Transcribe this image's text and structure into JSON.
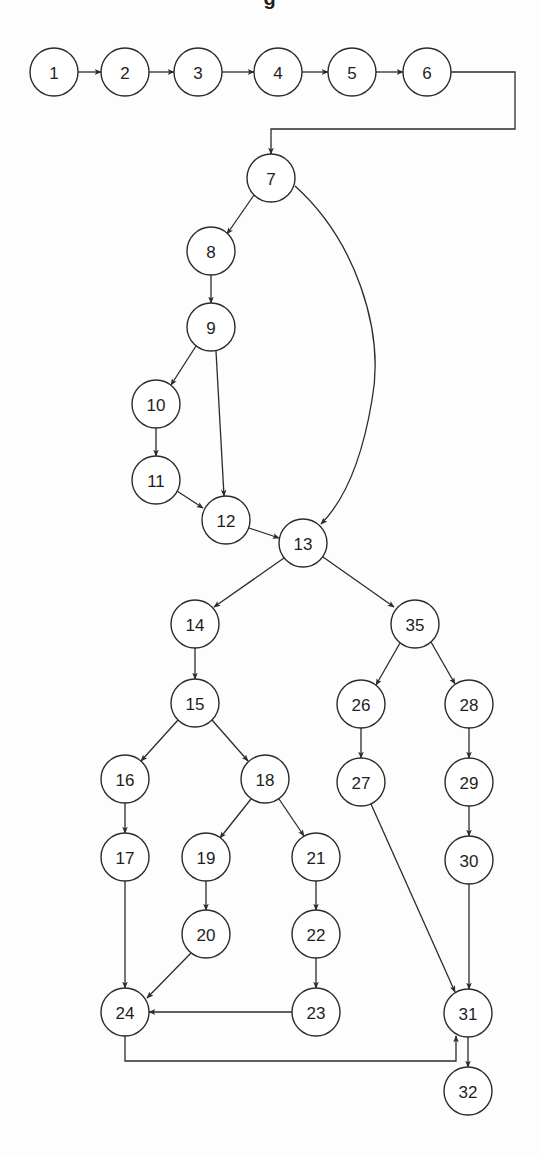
{
  "diagram": {
    "type": "control-flow-graph",
    "title_fragment": "g",
    "colors": {
      "stroke": "#2b2b2b",
      "node_fill": "#ffffff",
      "text": "#1e1e1e",
      "background": "#fdfdfd"
    },
    "node_radius": 24,
    "nodes": [
      {
        "id": "1",
        "label": "1",
        "x": 54,
        "y": 72
      },
      {
        "id": "2",
        "label": "2",
        "x": 125,
        "y": 72
      },
      {
        "id": "3",
        "label": "3",
        "x": 198,
        "y": 72
      },
      {
        "id": "4",
        "label": "4",
        "x": 278,
        "y": 72
      },
      {
        "id": "5",
        "label": "5",
        "x": 352,
        "y": 72
      },
      {
        "id": "6",
        "label": "6",
        "x": 427,
        "y": 72
      },
      {
        "id": "7",
        "label": "7",
        "x": 271,
        "y": 178
      },
      {
        "id": "8",
        "label": "8",
        "x": 211,
        "y": 251
      },
      {
        "id": "9",
        "label": "9",
        "x": 211,
        "y": 327
      },
      {
        "id": "10",
        "label": "10",
        "x": 156,
        "y": 404
      },
      {
        "id": "11",
        "label": "11",
        "x": 156,
        "y": 480
      },
      {
        "id": "12",
        "label": "12",
        "x": 226,
        "y": 520
      },
      {
        "id": "13",
        "label": "13",
        "x": 303,
        "y": 543
      },
      {
        "id": "14",
        "label": "14",
        "x": 195,
        "y": 624
      },
      {
        "id": "15",
        "label": "15",
        "x": 195,
        "y": 703
      },
      {
        "id": "16",
        "label": "16",
        "x": 125,
        "y": 779
      },
      {
        "id": "17",
        "label": "17",
        "x": 125,
        "y": 857
      },
      {
        "id": "18",
        "label": "18",
        "x": 265,
        "y": 779
      },
      {
        "id": "19",
        "label": "19",
        "x": 206,
        "y": 857
      },
      {
        "id": "20",
        "label": "20",
        "x": 206,
        "y": 934
      },
      {
        "id": "21",
        "label": "21",
        "x": 316,
        "y": 857
      },
      {
        "id": "22",
        "label": "22",
        "x": 316,
        "y": 934
      },
      {
        "id": "23",
        "label": "23",
        "x": 316,
        "y": 1012
      },
      {
        "id": "24",
        "label": "24",
        "x": 125,
        "y": 1012
      },
      {
        "id": "35",
        "label": "35",
        "x": 415,
        "y": 624
      },
      {
        "id": "26",
        "label": "26",
        "x": 361,
        "y": 704
      },
      {
        "id": "27",
        "label": "27",
        "x": 361,
        "y": 782
      },
      {
        "id": "28",
        "label": "28",
        "x": 469,
        "y": 704
      },
      {
        "id": "29",
        "label": "29",
        "x": 469,
        "y": 782
      },
      {
        "id": "30",
        "label": "30",
        "x": 469,
        "y": 860
      },
      {
        "id": "31",
        "label": "31",
        "x": 468,
        "y": 1013
      },
      {
        "id": "32",
        "label": "32",
        "x": 468,
        "y": 1091
      }
    ],
    "edges": [
      {
        "from": "1",
        "to": "2",
        "path": "M78,72 L101,72"
      },
      {
        "from": "2",
        "to": "3",
        "path": "M149,72 L174,72"
      },
      {
        "from": "3",
        "to": "4",
        "path": "M222,72 L254,72"
      },
      {
        "from": "4",
        "to": "5",
        "path": "M302,72 L328,72"
      },
      {
        "from": "5",
        "to": "6",
        "path": "M376,72 L403,72"
      },
      {
        "from": "6",
        "to": "7",
        "path": "M451,72 L515,72 L515,129 L271,129 L271,154"
      },
      {
        "from": "7",
        "to": "8",
        "path": "M254,195 L227,234"
      },
      {
        "from": "7",
        "to": "13",
        "path": "M295,186 C355,240 385,330 372,400 C362,460 345,500 321,524"
      },
      {
        "from": "8",
        "to": "9",
        "path": "M211,275 L211,303"
      },
      {
        "from": "9",
        "to": "10",
        "path": "M196,346 L171,385"
      },
      {
        "from": "9",
        "to": "12",
        "path": "M216,351 L224,496"
      },
      {
        "from": "10",
        "to": "11",
        "path": "M156,428 L156,456"
      },
      {
        "from": "11",
        "to": "12",
        "path": "M177,491 L203,508"
      },
      {
        "from": "12",
        "to": "13",
        "path": "M249,528 L279,538"
      },
      {
        "from": "13",
        "to": "14",
        "path": "M284,558 L214,607"
      },
      {
        "from": "13",
        "to": "35",
        "path": "M323,557 L394,607"
      },
      {
        "from": "14",
        "to": "15",
        "path": "M195,648 L195,679"
      },
      {
        "from": "15",
        "to": "16",
        "path": "M178,720 L141,761"
      },
      {
        "from": "15",
        "to": "18",
        "path": "M212,720 L248,761"
      },
      {
        "from": "16",
        "to": "17",
        "path": "M125,803 L125,833"
      },
      {
        "from": "17",
        "to": "24",
        "path": "M125,881 L125,988"
      },
      {
        "from": "18",
        "to": "19",
        "path": "M251,799 L220,838"
      },
      {
        "from": "18",
        "to": "21",
        "path": "M279,799 L304,836"
      },
      {
        "from": "19",
        "to": "20",
        "path": "M206,881 L206,910"
      },
      {
        "from": "20",
        "to": "24",
        "path": "M191,953 L147,998"
      },
      {
        "from": "21",
        "to": "22",
        "path": "M316,881 L316,910"
      },
      {
        "from": "22",
        "to": "23",
        "path": "M316,958 L316,988"
      },
      {
        "from": "23",
        "to": "24",
        "path": "M292,1012 L149,1012"
      },
      {
        "from": "24",
        "to": "31",
        "path": "M125,1036 L125,1061 L456,1061 L456,1036"
      },
      {
        "from": "35",
        "to": "26",
        "path": "M400,643 L376,685"
      },
      {
        "from": "35",
        "to": "28",
        "path": "M431,642 L455,684"
      },
      {
        "from": "26",
        "to": "27",
        "path": "M361,728 L361,758"
      },
      {
        "from": "28",
        "to": "29",
        "path": "M469,728 L469,758"
      },
      {
        "from": "29",
        "to": "30",
        "path": "M469,806 L469,836"
      },
      {
        "from": "27",
        "to": "31",
        "path": "M371,804 L455,992"
      },
      {
        "from": "30",
        "to": "31",
        "path": "M469,884 L469,989"
      },
      {
        "from": "31",
        "to": "32",
        "path": "M468,1037 L468,1067"
      }
    ]
  }
}
